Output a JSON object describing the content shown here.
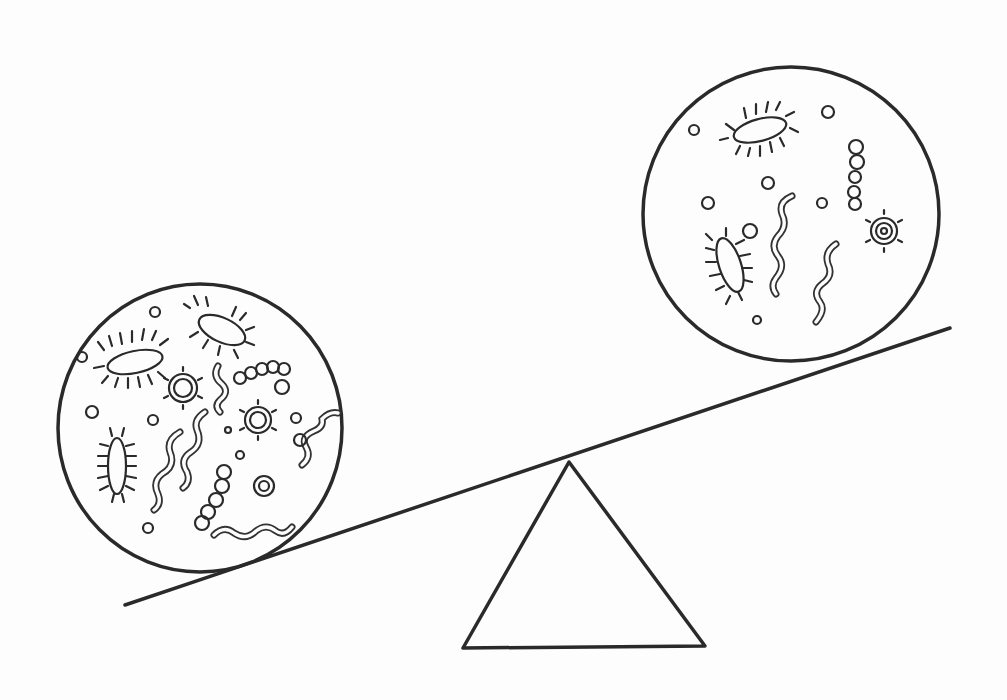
{
  "illustration": {
    "title": "",
    "description": "Hand-drawn seesaw balancing two circles of microbes",
    "colors": {
      "ink": "#2a2a2a",
      "paper": "#fdfdfd"
    },
    "left_circle": {
      "label": "",
      "contents": [
        "rod bacteria with flagella",
        "cocci",
        "chain cocci",
        "spiral bacteria",
        "spiky viruses"
      ],
      "side": "heavier (down)"
    },
    "right_circle": {
      "label": "",
      "contents": [
        "rod bacteria with flagella",
        "cocci",
        "chain cocci",
        "spiral bacteria",
        "spiky virus"
      ],
      "side": "lighter (up)"
    },
    "fulcrum": {
      "shape": "triangle"
    }
  }
}
